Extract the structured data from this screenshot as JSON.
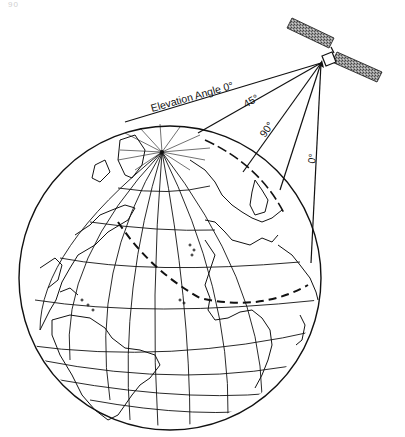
{
  "page": {
    "number": "90"
  },
  "diagram": {
    "labels": {
      "elevation_0_top": "Elevation Angle 0°",
      "elevation_45": "45°",
      "elevation_90": "90°",
      "elevation_0_right": "0°"
    },
    "elements": [
      "satellite",
      "earth-globe",
      "coverage-lines",
      "coverage-boundary-dashed",
      "sub-satellite-point"
    ],
    "colors": {
      "ink": "#111111",
      "background": "#ffffff"
    }
  }
}
